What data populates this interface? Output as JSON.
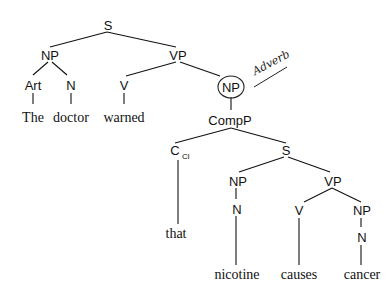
{
  "tree": {
    "nodes": {
      "s_root": "S",
      "np_subj": "NP",
      "vp_main": "VP",
      "art": "Art",
      "n_subj": "N",
      "v_main": "V",
      "np_circled": "NP",
      "compp": "CompP",
      "c": "C",
      "c_sub": "Cl",
      "s_embedded": "S",
      "np_embedded": "NP",
      "vp_embedded": "VP",
      "n_embedded": "N",
      "v_embedded": "V",
      "np_obj": "NP",
      "n_obj": "N"
    },
    "words": {
      "the": "The",
      "doctor": "doctor",
      "warned": "warned",
      "that": "that",
      "nicotine": "nicotine",
      "causes": "causes",
      "cancer": "cancer"
    },
    "annotation": "Adverb"
  }
}
